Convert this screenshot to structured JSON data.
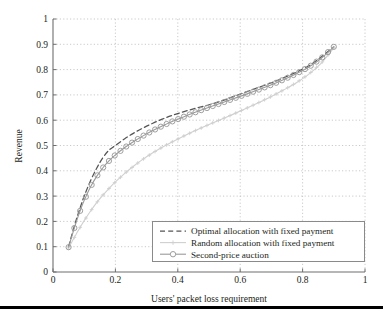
{
  "chart_data": {
    "type": "line",
    "title": "",
    "xlabel": "Users' packet loss requirement",
    "ylabel": "Revenue",
    "xlim": [
      0,
      1
    ],
    "ylim": [
      0,
      1
    ],
    "xticks": [
      "0",
      "0.2",
      "0.4",
      "0.6",
      "0.8",
      "1"
    ],
    "xtick_values": [
      0,
      0.2,
      0.4,
      0.6,
      0.8,
      1
    ],
    "yticks": [
      "0",
      "0.1",
      "0.2",
      "0.3",
      "0.4",
      "0.5",
      "0.6",
      "0.7",
      "0.8",
      "0.9",
      "1"
    ],
    "ytick_values": [
      0,
      0.1,
      0.2,
      0.3,
      0.4,
      0.5,
      0.6,
      0.7,
      0.8,
      0.9,
      1
    ],
    "grid": true,
    "grid_style": "dotted",
    "legend_position": "lower right",
    "series": [
      {
        "name": "Optimal allocation with fixed payment",
        "style": "dashed",
        "marker": "none",
        "color": "#555555",
        "x": [
          0.05,
          0.06,
          0.07,
          0.08,
          0.09,
          0.1,
          0.12,
          0.14,
          0.16,
          0.18,
          0.2,
          0.23,
          0.26,
          0.29,
          0.32,
          0.35,
          0.38,
          0.42,
          0.46,
          0.5,
          0.54,
          0.58,
          0.62,
          0.66,
          0.7,
          0.74,
          0.78,
          0.82,
          0.86,
          0.9
        ],
        "y": [
          0.1,
          0.145,
          0.188,
          0.228,
          0.265,
          0.3,
          0.36,
          0.41,
          0.452,
          0.482,
          0.5,
          0.527,
          0.55,
          0.57,
          0.588,
          0.604,
          0.618,
          0.634,
          0.648,
          0.661,
          0.676,
          0.694,
          0.712,
          0.73,
          0.748,
          0.768,
          0.79,
          0.815,
          0.85,
          0.89
        ]
      },
      {
        "name": "Random allocation with fixed payment",
        "style": "solid",
        "marker": "plus",
        "color": "#cfcfcf",
        "x": [
          0.05,
          0.06,
          0.07,
          0.08,
          0.09,
          0.1,
          0.12,
          0.14,
          0.16,
          0.18,
          0.2,
          0.23,
          0.26,
          0.29,
          0.32,
          0.35,
          0.38,
          0.42,
          0.46,
          0.5,
          0.54,
          0.58,
          0.62,
          0.66,
          0.7,
          0.74,
          0.78,
          0.82,
          0.86,
          0.9
        ],
        "y": [
          0.095,
          0.118,
          0.14,
          0.162,
          0.183,
          0.203,
          0.24,
          0.274,
          0.304,
          0.331,
          0.356,
          0.39,
          0.42,
          0.447,
          0.471,
          0.493,
          0.513,
          0.538,
          0.561,
          0.583,
          0.604,
          0.625,
          0.647,
          0.67,
          0.694,
          0.72,
          0.748,
          0.782,
          0.826,
          0.886
        ]
      },
      {
        "name": "Second-price auction",
        "style": "solid",
        "marker": "circle",
        "color": "#9a9a9a",
        "x": [
          0.05,
          0.06,
          0.07,
          0.08,
          0.09,
          0.1,
          0.12,
          0.14,
          0.16,
          0.18,
          0.2,
          0.23,
          0.26,
          0.29,
          0.32,
          0.35,
          0.38,
          0.42,
          0.46,
          0.5,
          0.54,
          0.58,
          0.62,
          0.66,
          0.7,
          0.74,
          0.78,
          0.82,
          0.86,
          0.9
        ],
        "y": [
          0.098,
          0.14,
          0.18,
          0.218,
          0.252,
          0.283,
          0.336,
          0.378,
          0.412,
          0.44,
          0.463,
          0.492,
          0.517,
          0.539,
          0.559,
          0.577,
          0.594,
          0.614,
          0.633,
          0.651,
          0.668,
          0.686,
          0.703,
          0.721,
          0.74,
          0.761,
          0.784,
          0.81,
          0.845,
          0.89
        ]
      }
    ]
  },
  "legend": {
    "items": [
      {
        "label": "Optimal allocation with fixed payment"
      },
      {
        "label": "Random allocation with fixed payment"
      },
      {
        "label": "Second-price auction"
      }
    ]
  },
  "colors": {
    "optimal": "#555555",
    "random": "#cfcfcf",
    "auction": "#9a9a9a",
    "axis": "#6e6e6e",
    "grid": "#bdbdbd",
    "rule": "#000000"
  }
}
